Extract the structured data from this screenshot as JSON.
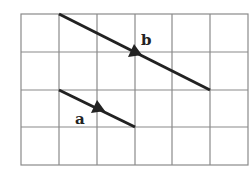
{
  "diagram": {
    "grid": {
      "cols": 6,
      "rows": 4,
      "left": 21,
      "top": 14,
      "cell": 37.8,
      "cell_h": 37.75,
      "line_color": "#8a8a8a"
    },
    "vectors": [
      {
        "name": "a",
        "label": "a",
        "from": [
          1,
          2
        ],
        "to": [
          3,
          3
        ],
        "color": "#222222"
      },
      {
        "name": "b",
        "label": "b",
        "from": [
          1,
          0
        ],
        "to": [
          5,
          2
        ],
        "color": "#222222"
      }
    ]
  }
}
